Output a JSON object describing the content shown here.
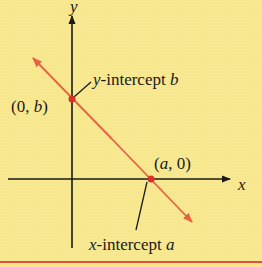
{
  "diagram": {
    "axes": {
      "x_label": "x",
      "y_label": "y"
    },
    "points": {
      "y_intercept_coord": {
        "open": "(0, ",
        "var": "b",
        "close": ")"
      },
      "x_intercept_coord": {
        "open": "(",
        "var": "a",
        "close": ", 0)"
      }
    },
    "annotations": {
      "y_intercept_label": {
        "var_prefix": "y",
        "text": "-intercept ",
        "var": "b"
      },
      "x_intercept_label": {
        "var_prefix": "x",
        "text": "-intercept ",
        "var": "a"
      }
    },
    "colors": {
      "background": "#f7e88f",
      "line": "#e8603f",
      "point": "#d9302a",
      "axis": "#1a1a1a",
      "bottom_rule": "#e0503a"
    }
  }
}
